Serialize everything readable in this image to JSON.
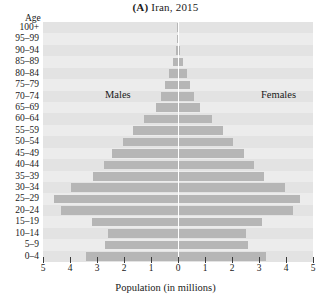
{
  "chart_data": {
    "type": "bar",
    "subtype": "population-pyramid",
    "title": "(A) Iran, 2015",
    "panel_letter": "(A)",
    "title_rest": " Iran, 2015",
    "xlabel": "Population (in millions)",
    "ylabel": "Age",
    "xlim": [
      -5,
      5
    ],
    "ylim_categories": 21,
    "grid": false,
    "legend_position": "inside-plot",
    "series_labels": {
      "left": "Males",
      "right": "Females"
    },
    "xticks": [
      5,
      4,
      3,
      2,
      1,
      0,
      1,
      2,
      3,
      4,
      5
    ],
    "xtick_values": [
      -5,
      -4,
      -3,
      -2,
      -1,
      0,
      1,
      2,
      3,
      4,
      5
    ],
    "categories": [
      "100+",
      "95–99",
      "90–94",
      "85–89",
      "80–84",
      "75–79",
      "70–74",
      "65–69",
      "60–64",
      "55–59",
      "50–54",
      "45–49",
      "40–44",
      "35–39",
      "30–34",
      "25–29",
      "20–24",
      "15–19",
      "10–14",
      "5–9",
      "0–4"
    ],
    "series": [
      {
        "name": "Males",
        "side": "left",
        "values": [
          0.01,
          0.03,
          0.07,
          0.17,
          0.35,
          0.48,
          0.62,
          0.82,
          1.25,
          1.65,
          2.05,
          2.45,
          2.75,
          3.15,
          3.95,
          4.6,
          4.35,
          3.2,
          2.6,
          2.7,
          3.4
        ]
      },
      {
        "name": "Females",
        "side": "right",
        "values": [
          0.01,
          0.04,
          0.08,
          0.18,
          0.34,
          0.46,
          0.6,
          0.82,
          1.25,
          1.68,
          2.05,
          2.45,
          2.8,
          3.2,
          3.95,
          4.5,
          4.25,
          3.1,
          2.5,
          2.6,
          3.25
        ]
      }
    ],
    "colors": {
      "bar": "#b6b6b6",
      "plot_background": "#e9e9e9",
      "band_alt": "#ececec",
      "centerline": "#ffffff",
      "text": "#1a1a1a",
      "tick": "#3a3a3a"
    }
  }
}
